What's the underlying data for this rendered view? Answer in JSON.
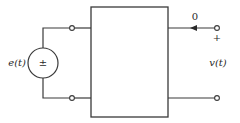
{
  "diagram": {
    "type": "two-port circuit",
    "source": {
      "label": "e(t)",
      "polarity_symbol": "±",
      "kind": "independent voltage source"
    },
    "network_box": {
      "label": ""
    },
    "output": {
      "current_label": "0",
      "plus_label": "+",
      "voltage_label": "v(t)"
    },
    "colors": {
      "line": "#3a3a3a",
      "background": "#ffffff"
    }
  }
}
